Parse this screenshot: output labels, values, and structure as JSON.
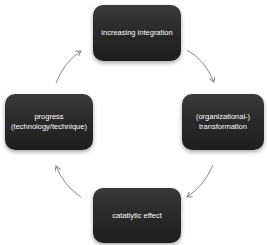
{
  "diagram": {
    "type": "cycle",
    "nodes": [
      {
        "id": "top",
        "label": "increasing integration"
      },
      {
        "id": "right",
        "label": "(organizational-)\ntransformation"
      },
      {
        "id": "bottom",
        "label": "catatlytic effect"
      },
      {
        "id": "left",
        "label": "progress\n(technology/technique)"
      }
    ],
    "edges": [
      {
        "from": "top",
        "to": "right"
      },
      {
        "from": "right",
        "to": "bottom"
      },
      {
        "from": "bottom",
        "to": "left"
      },
      {
        "from": "left",
        "to": "top"
      }
    ],
    "colors": {
      "node_fill": "#2a2a2a",
      "node_text": "#ffffff",
      "arrow": "#888888",
      "background": "#ffffff"
    }
  }
}
